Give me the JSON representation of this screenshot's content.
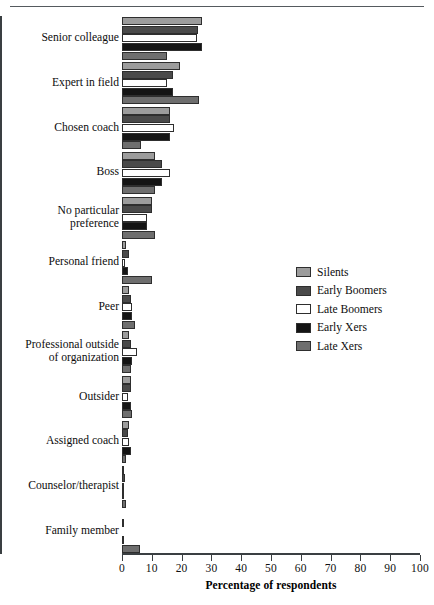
{
  "chart_data": {
    "type": "bar",
    "orientation": "horizontal",
    "title": "",
    "xlabel": "Percentage of respondents",
    "ylabel": "",
    "xlim": [
      0,
      100
    ],
    "xticks": [
      0,
      10,
      20,
      30,
      40,
      50,
      60,
      70,
      80,
      90,
      100
    ],
    "xtick_labels": [
      "0",
      "10",
      "20",
      "30",
      "40",
      "50",
      "60",
      "70",
      "80",
      "90",
      "100"
    ],
    "grid": false,
    "legend_position": "middle-right",
    "categories": [
      "Senior colleague",
      "Expert in field",
      "Chosen coach",
      "Boss",
      "No particular preference",
      "Personal friend",
      "Peer",
      "Professional outside of organization",
      "Outsider",
      "Assigned coach",
      "Counselor/therapist",
      "Family member"
    ],
    "category_lines": [
      [
        "Senior colleague"
      ],
      [
        "Expert in field"
      ],
      [
        "Chosen coach"
      ],
      [
        "Boss"
      ],
      [
        "No particular",
        "preference"
      ],
      [
        "Personal friend"
      ],
      [
        "Peer"
      ],
      [
        "Professional outside",
        "of organization"
      ],
      [
        "Outsider"
      ],
      [
        "Assigned coach"
      ],
      [
        "Counselor/therapist"
      ],
      [
        "Family member"
      ]
    ],
    "series": [
      {
        "name": "Silents",
        "color": "#9c9c9c",
        "values": [
          27,
          19.5,
          16,
          11,
          10,
          1.5,
          2.5,
          2.5,
          3,
          2.5,
          0.5,
          0
        ]
      },
      {
        "name": "Early Boomers",
        "color": "#4a4a4a",
        "values": [
          25.5,
          17,
          16,
          13.5,
          10,
          2.5,
          3,
          3,
          3,
          2,
          1,
          0.5
        ]
      },
      {
        "name": "Late Boomers",
        "color": "#ffffff",
        "values": [
          25,
          15,
          17.5,
          16,
          8.5,
          1,
          3.5,
          5,
          2,
          2.5,
          0.5,
          0
        ]
      },
      {
        "name": "Early Xers",
        "color": "#141414",
        "values": [
          27,
          17,
          16,
          13.5,
          8.5,
          2,
          3.5,
          3.5,
          3,
          3,
          0.5,
          0.5
        ]
      },
      {
        "name": "Late Xers",
        "color": "#6e6e6e",
        "values": [
          15,
          26,
          6.5,
          11,
          11,
          10,
          4.5,
          3,
          3.5,
          1.5,
          1.5,
          6
        ]
      }
    ]
  },
  "legend": {
    "items": [
      {
        "label": "Silents",
        "color": "#9c9c9c"
      },
      {
        "label": "Early Boomers",
        "color": "#4a4a4a"
      },
      {
        "label": "Late Boomers",
        "color": "#ffffff"
      },
      {
        "label": "Early Xers",
        "color": "#141414"
      },
      {
        "label": "Late Xers",
        "color": "#6e6e6e"
      }
    ]
  }
}
